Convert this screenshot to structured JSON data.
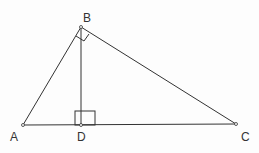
{
  "diagram": {
    "type": "right-triangle-with-altitude",
    "points": {
      "A": {
        "label": "A",
        "x": 23,
        "y": 125
      },
      "B": {
        "label": "B",
        "x": 81,
        "y": 27
      },
      "C": {
        "label": "C",
        "x": 236,
        "y": 124
      },
      "D": {
        "label": "D",
        "x": 81,
        "y": 125
      }
    },
    "segments": [
      "AB",
      "BC",
      "AC",
      "BD"
    ],
    "right_angles": [
      "ABC",
      "BDC"
    ],
    "stroke_color": "#333333"
  }
}
